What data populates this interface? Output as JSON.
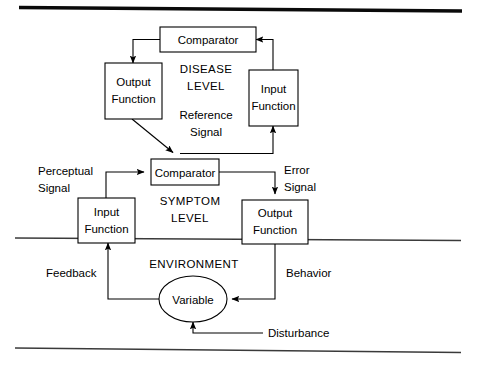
{
  "figure": {
    "rules": {
      "top": "thick-horizontal-rule",
      "bottom": "thin-horizontal-rule",
      "environment_boundary": "thin-horizontal-rule"
    }
  },
  "levels": {
    "disease": {
      "line1": "DISEASE",
      "line2": "LEVEL"
    },
    "symptom": {
      "line1": "SYMPTOM",
      "line2": "LEVEL"
    },
    "environment": {
      "line1": "ENVIRONMENT"
    }
  },
  "nodes": {
    "disease_comparator": {
      "label": "Comparator"
    },
    "disease_output_function": {
      "line1": "Output",
      "line2": "Function"
    },
    "disease_input_function": {
      "line1": "Input",
      "line2": "Function"
    },
    "symptom_comparator": {
      "label": "Comparator"
    },
    "symptom_input_function": {
      "line1": "Input",
      "line2": "Function"
    },
    "symptom_output_function": {
      "line1": "Output",
      "line2": "Function"
    },
    "environment_variable": {
      "label": "Variable"
    }
  },
  "edge_labels": {
    "reference_signal": {
      "line1": "Reference",
      "line2": "Signal"
    },
    "perceptual_signal": {
      "line1": "Perceptual",
      "line2": "Signal"
    },
    "error_signal": {
      "line1": "Error",
      "line2": "Signal"
    },
    "feedback": {
      "label": "Feedback"
    },
    "behavior": {
      "label": "Behavior"
    },
    "disturbance": {
      "label": "Disturbance"
    }
  },
  "colors": {
    "stroke": "#000000",
    "background": "#ffffff",
    "rule": "#0a0a0a"
  }
}
